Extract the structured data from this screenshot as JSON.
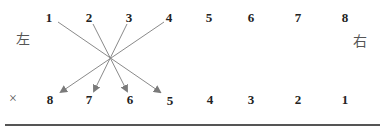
{
  "labels": {
    "left": "左",
    "right": "右",
    "cross": "×"
  },
  "top_row": [
    "1",
    "2",
    "3",
    "4",
    "5",
    "6",
    "7",
    "8"
  ],
  "bottom_row": [
    "8",
    "7",
    "6",
    "5",
    "4",
    "3",
    "2",
    "1"
  ],
  "arrows": [
    {
      "from": "1",
      "to": "5"
    },
    {
      "from": "2",
      "to": "6"
    },
    {
      "from": "3",
      "to": "7"
    },
    {
      "from": "4",
      "to": "8"
    }
  ],
  "colors": {
    "arrow": "#7a7a7a",
    "rule": "#555555"
  }
}
